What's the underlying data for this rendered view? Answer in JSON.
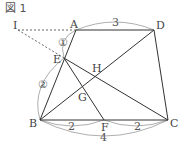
{
  "figure": {
    "title": "図 1",
    "points": {
      "A": "A",
      "B": "B",
      "C": "C",
      "D": "D",
      "E": "E",
      "F": "F",
      "G": "G",
      "H": "H",
      "I": "I"
    },
    "measures": {
      "AD": "3",
      "BF": "2",
      "FC": "2",
      "BC": "4",
      "AE_ratio": "①",
      "EB_ratio": "②"
    },
    "colors": {
      "line": "#333333",
      "dashed": "#555555",
      "arc": "#888888"
    }
  }
}
